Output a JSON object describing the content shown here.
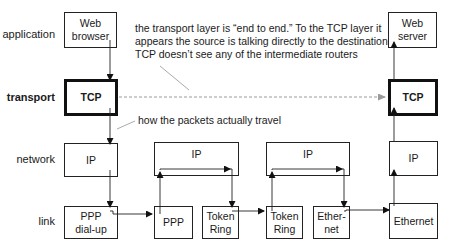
{
  "layers": {
    "application": "application",
    "transport": "transport",
    "network": "network",
    "link": "link"
  },
  "source_host": {
    "application": "Web\nbrowser",
    "transport": "TCP",
    "network": "IP",
    "link": "PPP\ndial-up"
  },
  "router1": {
    "network": "IP",
    "link_in": "PPP",
    "link_out": "Token\nRing"
  },
  "router2": {
    "network": "IP",
    "link_in": "Token\nRing",
    "link_out": "Ether-\nnet"
  },
  "dest_host": {
    "application": "Web\nserver",
    "transport": "TCP",
    "network": "IP",
    "link": "Ethernet"
  },
  "annotations": {
    "end_to_end": [
      "the transport layer is “end to end.” To the TCP layer it",
      "appears the source is talking directly to the destination.",
      "TCP doesn’t see any of the intermediate routers"
    ],
    "packet_path": "how the packets actually travel"
  },
  "colors": {
    "line": "#222222",
    "dashed": "#9a9a9a",
    "callout": "#a0a0a0"
  }
}
